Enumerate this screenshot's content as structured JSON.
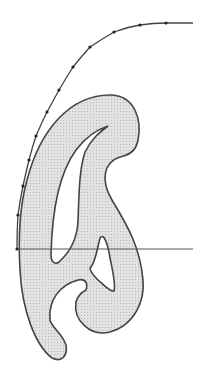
{
  "diagram": {
    "title": "",
    "colors": {
      "fill": "#d8d8d8",
      "stroke": "#444444",
      "background": "#ffffff",
      "point": "#222222"
    },
    "baseline": {
      "x1": 17,
      "y1": 249,
      "x2": 193,
      "y2": 249
    },
    "points": [
      [
        166,
        23
      ],
      [
        140,
        25
      ],
      [
        114,
        32
      ],
      [
        90,
        47
      ],
      [
        73,
        67
      ],
      [
        59,
        90
      ],
      [
        47,
        112
      ],
      [
        36,
        136
      ],
      [
        29,
        160
      ],
      [
        23,
        186
      ],
      [
        18,
        215
      ],
      [
        17,
        249
      ]
    ]
  }
}
